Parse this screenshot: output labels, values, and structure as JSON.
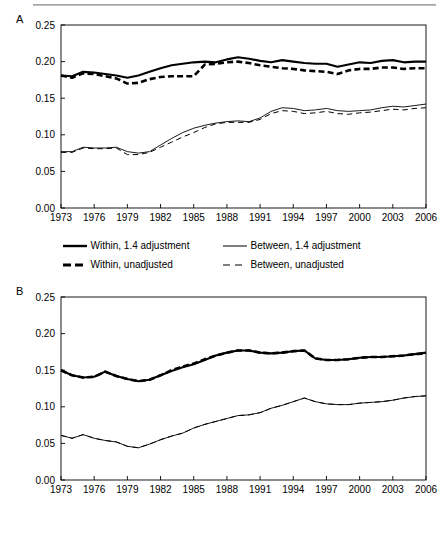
{
  "figure": {
    "panels": [
      {
        "letter": "A"
      },
      {
        "letter": "B"
      }
    ],
    "legend": {
      "items": [
        {
          "name": "within-14-adjustment",
          "label": "Within, 1.4 adjustment",
          "style": "solid-thick"
        },
        {
          "name": "between-14-adjustment",
          "label": "Between, 1.4 adjustment",
          "style": "solid-thin"
        },
        {
          "name": "within-unadjusted",
          "label": "Within, unadjusted",
          "style": "dashed-thick"
        },
        {
          "name": "between-unadjusted",
          "label": "Between, unadjusted",
          "style": "dashed-thin"
        }
      ]
    }
  },
  "chart_data": [
    {
      "panel": "A",
      "type": "line",
      "title": "",
      "xlabel": "",
      "ylabel": "",
      "xlim": [
        1973,
        2006
      ],
      "ylim": [
        0.0,
        0.25
      ],
      "ytick_labels": [
        "0.00",
        "0.05",
        "0.10",
        "0.15",
        "0.20",
        "0.25"
      ],
      "yticks": [
        0.0,
        0.05,
        0.1,
        0.15,
        0.2,
        0.25
      ],
      "xtick_labels": [
        "1973",
        "1976",
        "1979",
        "1982",
        "1985",
        "1988",
        "1991",
        "1994",
        "1997",
        "2000",
        "2003",
        "2006"
      ],
      "xticks": [
        1973,
        1976,
        1979,
        1982,
        1985,
        1988,
        1991,
        1994,
        1997,
        2000,
        2003,
        2006
      ],
      "grid": false,
      "legend_position": "below",
      "x": [
        1973,
        1974,
        1975,
        1976,
        1977,
        1978,
        1979,
        1980,
        1981,
        1982,
        1983,
        1984,
        1985,
        1986,
        1987,
        1988,
        1989,
        1990,
        1991,
        1992,
        1993,
        1994,
        1995,
        1996,
        1997,
        1998,
        1999,
        2000,
        2001,
        2002,
        2003,
        2004,
        2005,
        2006
      ],
      "series": [
        {
          "name": "Within, 1.4 adjustment",
          "style": "solid-thick",
          "values": [
            0.181,
            0.18,
            0.186,
            0.185,
            0.183,
            0.181,
            0.178,
            0.181,
            0.186,
            0.191,
            0.195,
            0.197,
            0.199,
            0.2,
            0.199,
            0.203,
            0.206,
            0.204,
            0.201,
            0.199,
            0.202,
            0.2,
            0.198,
            0.197,
            0.197,
            0.193,
            0.196,
            0.199,
            0.198,
            0.201,
            0.202,
            0.199,
            0.2,
            0.2
          ]
        },
        {
          "name": "Within, unadjusted",
          "style": "dashed-thick",
          "values": [
            0.181,
            0.178,
            0.184,
            0.183,
            0.18,
            0.177,
            0.17,
            0.171,
            0.176,
            0.179,
            0.18,
            0.18,
            0.18,
            0.196,
            0.197,
            0.199,
            0.2,
            0.198,
            0.195,
            0.193,
            0.191,
            0.19,
            0.188,
            0.187,
            0.186,
            0.183,
            0.188,
            0.19,
            0.19,
            0.192,
            0.192,
            0.19,
            0.191,
            0.191
          ]
        },
        {
          "name": "Between, 1.4 adjustment",
          "style": "solid-thin",
          "values": [
            0.077,
            0.077,
            0.083,
            0.082,
            0.082,
            0.083,
            0.077,
            0.075,
            0.077,
            0.086,
            0.095,
            0.103,
            0.109,
            0.113,
            0.116,
            0.118,
            0.119,
            0.118,
            0.123,
            0.132,
            0.137,
            0.136,
            0.133,
            0.134,
            0.136,
            0.133,
            0.132,
            0.133,
            0.134,
            0.137,
            0.139,
            0.138,
            0.14,
            0.142
          ]
        },
        {
          "name": "Between, unadjusted",
          "style": "dashed-thin",
          "values": [
            0.076,
            0.076,
            0.082,
            0.081,
            0.081,
            0.082,
            0.073,
            0.073,
            0.076,
            0.083,
            0.09,
            0.097,
            0.103,
            0.11,
            0.115,
            0.117,
            0.117,
            0.117,
            0.121,
            0.129,
            0.133,
            0.132,
            0.129,
            0.13,
            0.132,
            0.129,
            0.128,
            0.13,
            0.131,
            0.133,
            0.135,
            0.134,
            0.136,
            0.137
          ]
        }
      ]
    },
    {
      "panel": "B",
      "type": "line",
      "title": "",
      "xlabel": "",
      "ylabel": "",
      "xlim": [
        1973,
        2006
      ],
      "ylim": [
        0.0,
        0.25
      ],
      "ytick_labels": [
        "0.00",
        "0.05",
        "0.10",
        "0.15",
        "0.20",
        "0.25"
      ],
      "yticks": [
        0.0,
        0.05,
        0.1,
        0.15,
        0.2,
        0.25
      ],
      "xtick_labels": [
        "1973",
        "1976",
        "1979",
        "1982",
        "1985",
        "1988",
        "1991",
        "1994",
        "1997",
        "2000",
        "2003",
        "2006"
      ],
      "xticks": [
        1973,
        1976,
        1979,
        1982,
        1985,
        1988,
        1991,
        1994,
        1997,
        2000,
        2003,
        2006
      ],
      "grid": false,
      "legend_position": "below",
      "x": [
        1973,
        1974,
        1975,
        1976,
        1977,
        1978,
        1979,
        1980,
        1981,
        1982,
        1983,
        1984,
        1985,
        1986,
        1987,
        1988,
        1989,
        1990,
        1991,
        1992,
        1993,
        1994,
        1995,
        1996,
        1997,
        1998,
        1999,
        2000,
        2001,
        2002,
        2003,
        2004,
        2005,
        2006
      ],
      "series": [
        {
          "name": "Within, 1.4 adjustment",
          "style": "solid-thick",
          "values": [
            0.15,
            0.143,
            0.14,
            0.141,
            0.148,
            0.142,
            0.138,
            0.135,
            0.137,
            0.143,
            0.149,
            0.154,
            0.158,
            0.164,
            0.17,
            0.174,
            0.177,
            0.177,
            0.174,
            0.173,
            0.174,
            0.176,
            0.177,
            0.166,
            0.164,
            0.164,
            0.165,
            0.167,
            0.168,
            0.168,
            0.169,
            0.17,
            0.172,
            0.174
          ]
        },
        {
          "name": "Within, unadjusted",
          "style": "dashed-thick",
          "values": [
            0.15,
            0.143,
            0.14,
            0.141,
            0.148,
            0.142,
            0.138,
            0.135,
            0.137,
            0.143,
            0.15,
            0.155,
            0.159,
            0.165,
            0.17,
            0.174,
            0.177,
            0.177,
            0.174,
            0.173,
            0.174,
            0.176,
            0.177,
            0.166,
            0.164,
            0.164,
            0.165,
            0.167,
            0.168,
            0.168,
            0.169,
            0.17,
            0.172,
            0.173
          ]
        },
        {
          "name": "Between, 1.4 adjustment",
          "style": "solid-thin",
          "values": [
            0.061,
            0.057,
            0.062,
            0.057,
            0.054,
            0.052,
            0.046,
            0.044,
            0.049,
            0.055,
            0.06,
            0.064,
            0.071,
            0.076,
            0.08,
            0.084,
            0.088,
            0.089,
            0.092,
            0.098,
            0.102,
            0.107,
            0.112,
            0.107,
            0.104,
            0.103,
            0.103,
            0.105,
            0.106,
            0.107,
            0.109,
            0.112,
            0.114,
            0.115
          ]
        },
        {
          "name": "Between, unadjusted",
          "style": "dashed-thin",
          "values": [
            0.061,
            0.057,
            0.062,
            0.057,
            0.054,
            0.052,
            0.046,
            0.044,
            0.049,
            0.055,
            0.06,
            0.064,
            0.071,
            0.076,
            0.08,
            0.084,
            0.088,
            0.089,
            0.092,
            0.098,
            0.102,
            0.107,
            0.112,
            0.107,
            0.104,
            0.103,
            0.103,
            0.105,
            0.106,
            0.107,
            0.109,
            0.112,
            0.114,
            0.115
          ]
        }
      ]
    }
  ]
}
